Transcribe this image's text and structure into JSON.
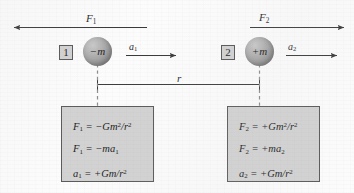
{
  "figure": {
    "background_color": "#fcfcfc",
    "line_color": "#3a3a3a",
    "box_fill_color": "#d2d2d2",
    "box_border_color": "#5a5a5a",
    "sphere_color": "#9d9d9d",
    "text_color": "#1d1d1d"
  },
  "force_arrows": [
    {
      "name": "F1",
      "label_base": "F",
      "label_sub": "1",
      "direction": "left",
      "x_start": 12,
      "x_end": 147,
      "y": 27
    },
    {
      "name": "F2",
      "label_base": "F",
      "label_sub": "2",
      "direction": "right",
      "x_start": 250,
      "x_end": 345,
      "y": 27
    }
  ],
  "acceleration_arrows": [
    {
      "name": "a1",
      "label_base": "a",
      "label_sub": "1",
      "direction": "right",
      "x_start": 126,
      "x_end": 177,
      "y": 55
    },
    {
      "name": "a2",
      "label_base": "a",
      "label_sub": "2",
      "direction": "right",
      "x_start": 285,
      "x_end": 338,
      "y": 55
    }
  ],
  "distance": {
    "label": "r",
    "x_start": 97,
    "x_end": 260,
    "y": 84
  },
  "particles": [
    {
      "index": "1",
      "mass_sign": "−",
      "mass_symbol": "m",
      "mass_label": "−m",
      "center_x": 97,
      "center_y": 52
    },
    {
      "index": "2",
      "mass_sign": "+",
      "mass_symbol": "m",
      "mass_label": "+m",
      "center_x": 260,
      "center_y": 52
    }
  ],
  "formula_boxes": [
    {
      "name": "left-equations",
      "lines": [
        {
          "lhs_base": "F",
          "lhs_sub": "1",
          "eq": "=",
          "sign": "−",
          "rhs_text": "Gm",
          "rhs_sup": "2",
          "rhs_tail": "/r",
          "rhs_tail_sup": "2",
          "plain": "F1 = −Gm²/r²"
        },
        {
          "lhs_base": "F",
          "lhs_sub": "1",
          "eq": "=",
          "sign": "−",
          "rhs_text": "ma",
          "rhs_sup": "",
          "rhs_tail": "",
          "rhs_tail_sup": "",
          "rhs_sub": "1",
          "plain": "F1 = −ma1"
        },
        {
          "lhs_base": "a",
          "lhs_sub": "1",
          "eq": "=",
          "sign": "+",
          "rhs_text": "Gm",
          "rhs_sup": "",
          "rhs_tail": "/r",
          "rhs_tail_sup": "2",
          "plain": "a1 = +Gm/r²"
        }
      ]
    },
    {
      "name": "right-equations",
      "lines": [
        {
          "lhs_base": "F",
          "lhs_sub": "2",
          "eq": "=",
          "sign": "+",
          "rhs_text": "Gm",
          "rhs_sup": "2",
          "rhs_tail": "/r",
          "rhs_tail_sup": "2",
          "plain": "F2 = +Gm²/r²"
        },
        {
          "lhs_base": "F",
          "lhs_sub": "2",
          "eq": "=",
          "sign": "+",
          "rhs_text": "ma",
          "rhs_sup": "",
          "rhs_tail": "",
          "rhs_tail_sup": "",
          "rhs_sub": "2",
          "plain": "F2 = +ma2"
        },
        {
          "lhs_base": "a",
          "lhs_sub": "2",
          "eq": "=",
          "sign": "+",
          "rhs_text": "Gm",
          "rhs_sup": "",
          "rhs_tail": "/r",
          "rhs_tail_sup": "2",
          "plain": "a2 = +Gm/r²"
        }
      ]
    }
  ],
  "labels": {
    "F1": {
      "base": "F",
      "sub": "1"
    },
    "F2": {
      "base": "F",
      "sub": "2"
    },
    "a1": {
      "base": "a",
      "sub": "1"
    },
    "a2": {
      "base": "a",
      "sub": "2"
    },
    "r": "r",
    "index1": "1",
    "index2": "2",
    "mass1": "−m",
    "mass2": "+m"
  }
}
